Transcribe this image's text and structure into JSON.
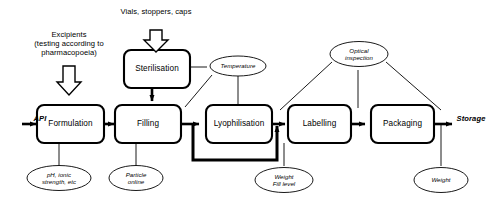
{
  "diagram": {
    "type": "process-flowchart",
    "style": {
      "background": "#ffffff",
      "line_color": "#000000",
      "box_fill": "#ffffff",
      "ellipse_fill": "#ffffff"
    },
    "inputs": [
      {
        "id": "api",
        "label": "API",
        "style": "italic-bold",
        "target": "formulation"
      },
      {
        "id": "excipients",
        "label": "Excipients\n(testing according to\npharmacopoeia)",
        "arrow": "hollow-block-down",
        "target": "formulation"
      },
      {
        "id": "vials",
        "label": "Vials, stoppers, caps",
        "arrow": "hollow-block-down",
        "target": "sterilisation"
      }
    ],
    "outputs": [
      {
        "id": "storage",
        "label": "Storage",
        "style": "italic-bold",
        "source": "packaging"
      }
    ],
    "process_steps": [
      {
        "id": "formulation",
        "label": "Formulation"
      },
      {
        "id": "filling",
        "label": "Filling"
      },
      {
        "id": "sterilisation",
        "label": "Sterilisation"
      },
      {
        "id": "lyophilisation",
        "label": "Lyophilisation"
      },
      {
        "id": "labelling",
        "label": "Labelling"
      },
      {
        "id": "packaging",
        "label": "Packaging"
      }
    ],
    "measurements": [
      {
        "id": "ph-ionic",
        "label": "pH, ionic\nstrength, etc",
        "attached_to": [
          "formulation"
        ]
      },
      {
        "id": "particle",
        "label": "Particle\nonline",
        "attached_to": [
          "filling"
        ]
      },
      {
        "id": "temperature",
        "label": "Temperature",
        "attached_to": [
          "sterilisation",
          "filling",
          "lyophilisation"
        ]
      },
      {
        "id": "weight-fill",
        "label": "Weight\nFill level",
        "attached_to": [
          "lyophilisation"
        ]
      },
      {
        "id": "optical",
        "label": "Optical\ninspection",
        "attached_to": [
          "lyophilisation",
          "labelling",
          "packaging"
        ]
      },
      {
        "id": "weight",
        "label": "Weight",
        "attached_to": [
          "packaging"
        ]
      }
    ],
    "flow_sequence": [
      "api",
      "formulation",
      "filling",
      "lyophilisation",
      "labelling",
      "packaging",
      "storage"
    ],
    "feedback_loop": {
      "id": "bypass-loop",
      "from": "filling",
      "to": "labelling",
      "description": "Thick bypass route from Filling output around Lyophilisation into Labelling input"
    }
  }
}
